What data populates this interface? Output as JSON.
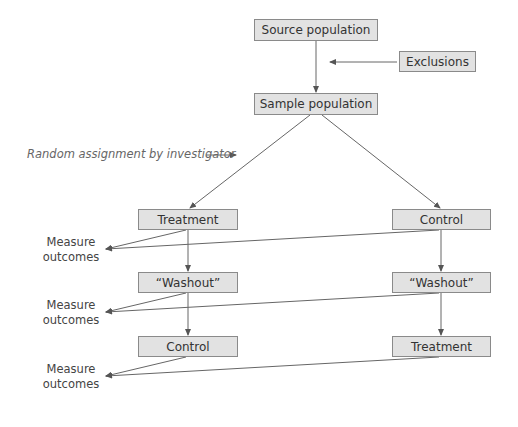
{
  "diagram": {
    "nodes": {
      "source": "Source population",
      "exclusions": "Exclusions",
      "sample": "Sample population",
      "left_1": "Treatment",
      "right_1": "Control",
      "left_2": "“Washout”",
      "right_2": "“Washout”",
      "left_3": "Control",
      "right_3": "Treatment"
    },
    "annotations": {
      "random_assignment": "Random assignment by investigator",
      "measure_1_line1": "Measure",
      "measure_1_line2": "outcomes",
      "measure_2_line1": "Measure",
      "measure_2_line2": "outcomes",
      "measure_3_line1": "Measure",
      "measure_3_line2": "outcomes"
    },
    "colors": {
      "box_fill": "#e2e2e2",
      "box_border": "#8a8a8a",
      "line": "#666666"
    }
  }
}
